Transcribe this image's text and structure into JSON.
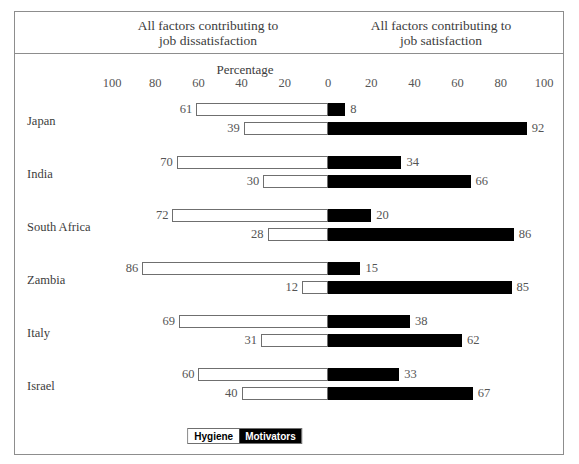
{
  "header": {
    "left_title": "All factors contributing to\njob dissatisfaction",
    "left_line1": "All factors contributing to",
    "left_line2": "job dissatisfaction",
    "right_line1": "All factors contributing to",
    "right_line2": "job satisfaction"
  },
  "axis": {
    "title": "Percentage",
    "ticks": [
      "100",
      "80",
      "60",
      "40",
      "20",
      "0",
      "20",
      "40",
      "60",
      "80",
      "100"
    ],
    "tick_values": [
      -100,
      -80,
      -60,
      -40,
      -20,
      0,
      20,
      40,
      60,
      80,
      100
    ]
  },
  "legend": {
    "hygiene_label": "Hygiene",
    "motivators_label": "Motivators"
  },
  "colors": {
    "hygiene_fill": "#ffffff",
    "hygiene_stroke": "#6f6f6f",
    "motivators_fill": "#000000",
    "frame": "#8d8d8d",
    "text": "#3c3c3c",
    "value_text": "#555555"
  },
  "chart_data": {
    "type": "bar",
    "title": "Percentage",
    "subtitle": "",
    "xlabel": "Percentage",
    "ylabel": "",
    "xlim": [
      -100,
      100
    ],
    "grid": false,
    "legend_position": "bottom-center",
    "orientation": "horizontal-diverging",
    "categories": [
      "Japan",
      "India",
      "South Africa",
      "Zambia",
      "Italy",
      "Israel"
    ],
    "series": [
      {
        "name": "Hygiene",
        "dissatisfaction": [
          61,
          70,
          72,
          86,
          69,
          60
        ],
        "satisfaction": [
          8,
          34,
          20,
          15,
          38,
          33
        ]
      },
      {
        "name": "Motivators",
        "dissatisfaction": [
          39,
          30,
          28,
          12,
          31,
          40
        ],
        "satisfaction": [
          92,
          66,
          86,
          85,
          62,
          67
        ]
      }
    ],
    "rows": [
      {
        "country": "Japan",
        "bars": [
          {
            "series": "Hygiene",
            "left_value": 61,
            "right_value": 8
          },
          {
            "series": "Motivators",
            "left_value": 39,
            "right_value": 92
          }
        ]
      },
      {
        "country": "India",
        "bars": [
          {
            "series": "Hygiene",
            "left_value": 70,
            "right_value": 34
          },
          {
            "series": "Motivators",
            "left_value": 30,
            "right_value": 66
          }
        ]
      },
      {
        "country": "South Africa",
        "bars": [
          {
            "series": "Hygiene",
            "left_value": 72,
            "right_value": 20
          },
          {
            "series": "Motivators",
            "left_value": 28,
            "right_value": 86
          }
        ]
      },
      {
        "country": "Zambia",
        "bars": [
          {
            "series": "Hygiene",
            "left_value": 86,
            "right_value": 15
          },
          {
            "series": "Motivators",
            "left_value": 12,
            "right_value": 85
          }
        ]
      },
      {
        "country": "Italy",
        "bars": [
          {
            "series": "Hygiene",
            "left_value": 69,
            "right_value": 38
          },
          {
            "series": "Motivators",
            "left_value": 31,
            "right_value": 62
          }
        ]
      },
      {
        "country": "Israel",
        "bars": [
          {
            "series": "Hygiene",
            "left_value": 60,
            "right_value": 33
          },
          {
            "series": "Motivators",
            "left_value": 40,
            "right_value": 67
          }
        ]
      }
    ]
  }
}
